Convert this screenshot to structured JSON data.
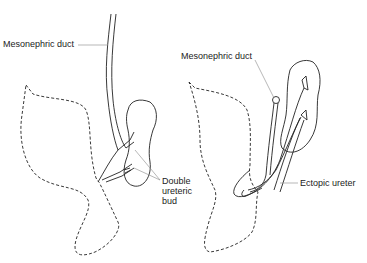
{
  "diagram": {
    "panels": [
      {
        "id": "left",
        "labels": {
          "mesonephric_duct": "Mesonephric duct",
          "double_ureteric_bud_line1": "Double",
          "double_ureteric_bud_line2": "ureteric",
          "double_ureteric_bud_line3": "bud"
        }
      },
      {
        "id": "right",
        "labels": {
          "mesonephric_duct": "Mesonephric duct",
          "ectopic_ureter": "Ectopic ureter"
        }
      }
    ],
    "colors": {
      "line": "#222222",
      "leader": "#888888",
      "background": "#ffffff"
    }
  }
}
